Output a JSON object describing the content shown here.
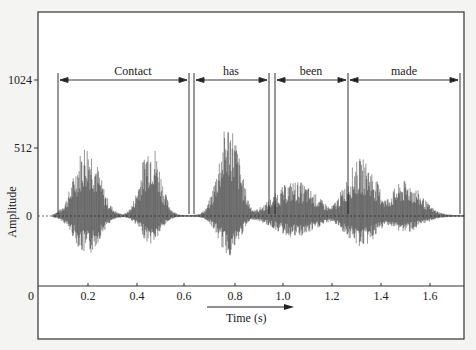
{
  "chart_data": {
    "type": "line",
    "subtype": "waveform",
    "title": "",
    "xlabel": "Time (s)",
    "ylabel": "Amplitude",
    "x_ticks": [
      "0",
      "0.2",
      "0.4",
      "0.6",
      "0.8",
      "1.0",
      "1.2",
      "1.4",
      "1.6"
    ],
    "y_ticks": [
      "0",
      "512",
      "1024"
    ],
    "xlim": [
      0,
      1.75
    ],
    "ylim": [
      -512,
      1400
    ],
    "grid": false,
    "legend": null,
    "segments": [
      {
        "word": "Contact",
        "start": 0.08,
        "end": 0.62
      },
      {
        "word": "has",
        "start": 0.64,
        "end": 0.95
      },
      {
        "word": "been",
        "start": 0.97,
        "end": 1.27
      },
      {
        "word": "made",
        "start": 1.27,
        "end": 1.73
      }
    ],
    "envelope_peaks": [
      {
        "t": 0.2,
        "pos": 560,
        "neg": -300
      },
      {
        "t": 0.46,
        "pos": 580,
        "neg": -210
      },
      {
        "t": 0.78,
        "pos": 720,
        "neg": -300
      },
      {
        "t": 1.05,
        "pos": 260,
        "neg": -160
      },
      {
        "t": 1.32,
        "pos": 430,
        "neg": -230
      },
      {
        "t": 1.5,
        "pos": 260,
        "neg": -120
      }
    ]
  },
  "axis": {
    "y_labels": {
      "top": "1024",
      "mid": "512",
      "zero": "0"
    },
    "y_title": "Amplitude",
    "x_origin": "0",
    "x_labels": [
      "0.2",
      "0.4",
      "0.6",
      "0.8",
      "1.0",
      "1.2",
      "1.4",
      "1.6"
    ],
    "x_title": "Time (s)"
  },
  "words": [
    "Contact",
    "has",
    "been",
    "made"
  ]
}
